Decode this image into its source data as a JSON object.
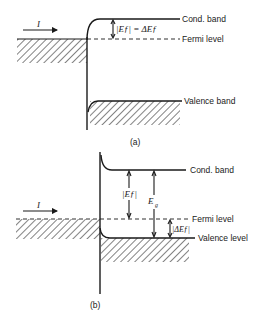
{
  "panel_a": {
    "current_label": "I",
    "cond_band_label": "Cond. band",
    "fermi_label": "Fermi level",
    "valence_label": "Valence band",
    "energy_annotation": "|Eƒ| = ΔEƒ",
    "caption": "(a)"
  },
  "panel_b": {
    "current_label": "I",
    "cond_band_label": "Cond. band",
    "fermi_label": "Fermi level",
    "valence_label": "Valence level",
    "ef_annotation": "|Eƒ|",
    "eg_annotation": "E",
    "eg_subscript": "g",
    "delta_annotation": "|ΔEƒ|",
    "caption": "(b)"
  }
}
